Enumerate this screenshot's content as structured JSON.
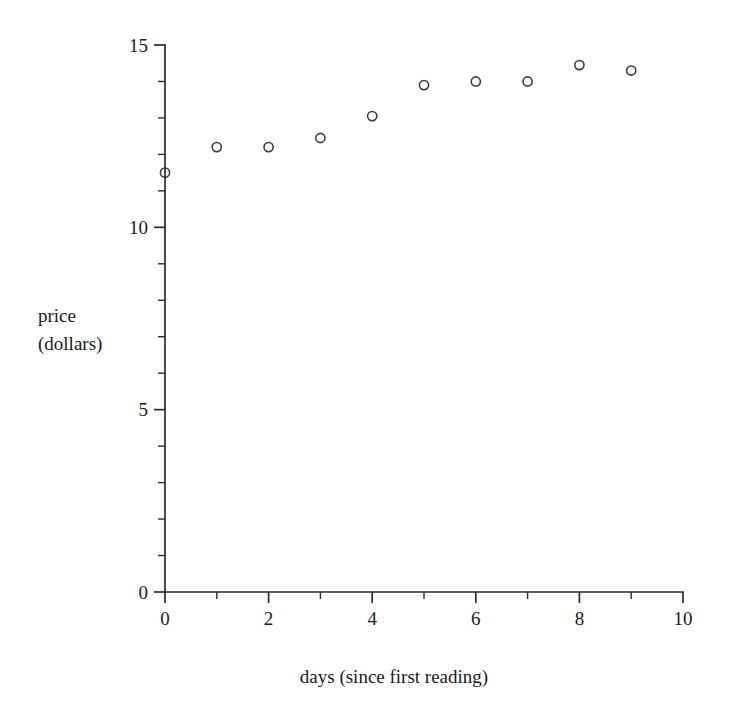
{
  "chart_data": {
    "type": "scatter",
    "title": "",
    "xlabel": "days (since first reading)",
    "ylabel": "price\n(dollars)",
    "ylabel_line1": "price",
    "ylabel_line2": "(dollars)",
    "xlim": [
      0,
      10
    ],
    "ylim": [
      0,
      15
    ],
    "grid": false,
    "legend": null,
    "x_major_ticks": [
      0,
      2,
      4,
      6,
      8,
      10
    ],
    "x_minor_ticks": [
      1,
      3,
      5,
      7,
      9
    ],
    "x_tick_labels": [
      "0",
      "2",
      "4",
      "6",
      "8",
      "10"
    ],
    "y_major_ticks": [
      0,
      5,
      10,
      15
    ],
    "y_minor_ticks": [
      1,
      2,
      3,
      4,
      6,
      7,
      8,
      9,
      11,
      12,
      13,
      14
    ],
    "y_tick_labels": [
      "0",
      "5",
      "10",
      "15"
    ],
    "marker_style": "open-circle",
    "marker_color": "#3a3a44",
    "x": [
      0,
      1,
      2,
      3,
      4,
      5,
      6,
      7,
      8,
      9
    ],
    "values": [
      11.5,
      12.2,
      12.2,
      12.45,
      13.05,
      13.9,
      14.0,
      14.0,
      14.45,
      14.3
    ],
    "points": [
      {
        "x": 0,
        "y": 11.5
      },
      {
        "x": 1,
        "y": 12.2
      },
      {
        "x": 2,
        "y": 12.2
      },
      {
        "x": 3,
        "y": 12.45
      },
      {
        "x": 4,
        "y": 13.05
      },
      {
        "x": 5,
        "y": 13.9
      },
      {
        "x": 6,
        "y": 14.0
      },
      {
        "x": 7,
        "y": 14.0
      },
      {
        "x": 8,
        "y": 14.45
      },
      {
        "x": 9,
        "y": 14.3
      }
    ]
  }
}
